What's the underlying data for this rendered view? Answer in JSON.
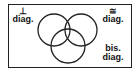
{
  "diagram": {
    "type": "venn",
    "sets": [
      {
        "id": "perpendicular",
        "symbol": "⊥",
        "label": "diag."
      },
      {
        "id": "congruent",
        "symbol": "≅",
        "label": "diag."
      },
      {
        "id": "bisecting",
        "symbol": "bis.",
        "label": "diag."
      }
    ],
    "colors": {
      "stroke": "#222222",
      "background": "#ffffff"
    }
  }
}
